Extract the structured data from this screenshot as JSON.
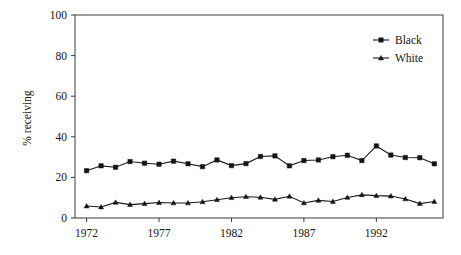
{
  "chart_data": {
    "type": "line",
    "title": "",
    "subtitle": "",
    "xlabel": "",
    "ylabel": "% receiving",
    "xlim": [
      1971.2,
      1996.6
    ],
    "ylim": [
      0,
      100
    ],
    "grid": false,
    "legend_position": "top-right",
    "x": [
      1972,
      1973,
      1974,
      1975,
      1976,
      1977,
      1978,
      1979,
      1980,
      1981,
      1982,
      1983,
      1984,
      1985,
      1986,
      1987,
      1988,
      1989,
      1990,
      1991,
      1992,
      1993,
      1994,
      1995,
      1996
    ],
    "xticks": [
      1972,
      1977,
      1982,
      1987,
      1992
    ],
    "xticklabels": [
      "1972",
      "1977",
      "1982",
      "1987",
      "1992"
    ],
    "yticks": [
      0,
      20,
      40,
      60,
      80,
      100
    ],
    "yticklabels": [
      "0",
      "20",
      "40",
      "60",
      "80",
      "100"
    ],
    "series": [
      {
        "name": "Black",
        "marker": "square",
        "color": "#141414",
        "values": [
          23.3,
          25.7,
          25.0,
          27.8,
          27.0,
          26.5,
          28.0,
          26.7,
          25.3,
          28.6,
          25.8,
          26.8,
          30.3,
          30.6,
          25.7,
          28.3,
          28.6,
          30.2,
          30.9,
          28.3,
          35.5,
          31.0,
          29.8,
          29.7,
          26.7
        ]
      },
      {
        "name": "White",
        "marker": "triangle",
        "color": "#141414",
        "values": [
          5.9,
          5.4,
          7.7,
          6.6,
          7.1,
          7.6,
          7.4,
          7.4,
          8.0,
          9.0,
          10.0,
          10.5,
          10.2,
          9.2,
          10.7,
          7.4,
          8.7,
          8.1,
          10.1,
          11.4,
          11.0,
          10.8,
          9.4,
          7.1,
          8.1
        ]
      }
    ]
  },
  "legend": {
    "entries": [
      {
        "label": "Black"
      },
      {
        "label": "White"
      }
    ]
  },
  "axes": {
    "y_title": "% receiving"
  }
}
